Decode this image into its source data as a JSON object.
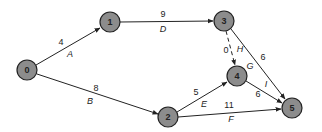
{
  "diagram": {
    "type": "activity-on-arrow network",
    "colors": {
      "node_fill": "#8c8c8c",
      "node_stroke": "#222222",
      "edge": "#222222",
      "background": "#ffffff"
    },
    "nodes": [
      {
        "id": "0",
        "label": "0",
        "x": 27,
        "y": 70
      },
      {
        "id": "1",
        "label": "1",
        "x": 110,
        "y": 22
      },
      {
        "id": "2",
        "label": "2",
        "x": 168,
        "y": 117
      },
      {
        "id": "3",
        "label": "3",
        "x": 224,
        "y": 21
      },
      {
        "id": "4",
        "label": "4",
        "x": 237,
        "y": 76
      },
      {
        "id": "5",
        "label": "5",
        "x": 292,
        "y": 108
      }
    ],
    "edges": [
      {
        "from": "0",
        "to": "1",
        "duration": "4",
        "activity": "A",
        "dashed": false
      },
      {
        "from": "0",
        "to": "2",
        "duration": "8",
        "activity": "B",
        "dashed": false
      },
      {
        "from": "1",
        "to": "3",
        "duration": "9",
        "activity": "D",
        "dashed": false
      },
      {
        "from": "3",
        "to": "4",
        "duration": "0",
        "activity": "H",
        "dashed": true
      },
      {
        "from": "3",
        "to": "5",
        "duration": "6",
        "activity": "G",
        "dashed": false
      },
      {
        "from": "2",
        "to": "4",
        "duration": "5",
        "activity": "E",
        "dashed": false
      },
      {
        "from": "2",
        "to": "5",
        "duration": "11",
        "activity": "F",
        "dashed": false
      },
      {
        "from": "4",
        "to": "5",
        "duration": "6",
        "activity": "I",
        "dashed": false
      }
    ]
  }
}
